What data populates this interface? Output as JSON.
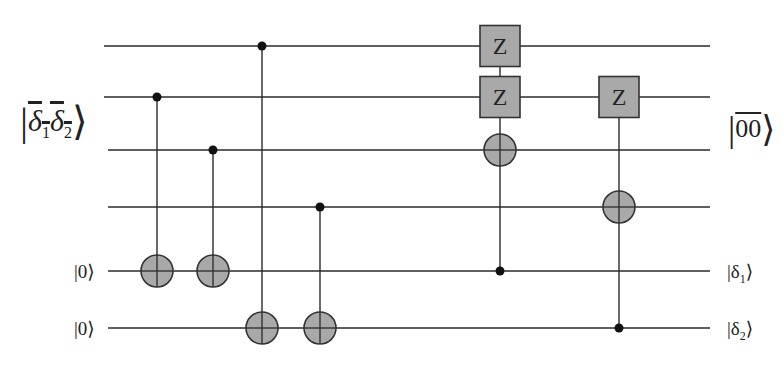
{
  "diagram": {
    "type": "quantum-circuit",
    "colors": {
      "wire": "#2a2a2a",
      "gate_fill": "#a9a9a9",
      "gate_stroke": "#333333",
      "control_dot": "#111111",
      "background": "#ffffff"
    },
    "wires": [
      {
        "id": "q1",
        "y": 46,
        "x_start": 104,
        "x_end": 710
      },
      {
        "id": "q2",
        "y": 97,
        "x_start": 104,
        "x_end": 710
      },
      {
        "id": "q3",
        "y": 150,
        "x_start": 108,
        "x_end": 710
      },
      {
        "id": "q4",
        "y": 207,
        "x_start": 108,
        "x_end": 710
      },
      {
        "id": "q5",
        "y": 271,
        "x_start": 108,
        "x_end": 710
      },
      {
        "id": "q6",
        "y": 328,
        "x_start": 108,
        "x_end": 710
      }
    ],
    "input_labels": {
      "data_register": {
        "symbol": "δ1δ2",
        "parts": [
          "δ",
          "1",
          "δ",
          "2"
        ],
        "overline": true,
        "spans_wires": [
          "q1",
          "q2",
          "q3",
          "q4"
        ]
      },
      "ancilla_1": {
        "text": "|0⟩",
        "wire": "q5"
      },
      "ancilla_2": {
        "text": "|0⟩",
        "wire": "q6"
      }
    },
    "output_labels": {
      "data_register": {
        "text": "00",
        "overline": true,
        "spans_wires": [
          "q1",
          "q2",
          "q3",
          "q4"
        ]
      },
      "ancilla_1": {
        "symbol": "δ",
        "sub": "1",
        "wire": "q5"
      },
      "ancilla_2": {
        "symbol": "δ",
        "sub": "2",
        "wire": "q6"
      }
    },
    "gates": [
      {
        "type": "CNOT",
        "x": 157,
        "control": "q2",
        "target": "q5"
      },
      {
        "type": "CNOT",
        "x": 213,
        "control": "q3",
        "target": "q5"
      },
      {
        "type": "CNOT",
        "x": 262,
        "control": "q1",
        "target": "q6"
      },
      {
        "type": "CNOT",
        "x": 320,
        "control": "q4",
        "target": "q6"
      },
      {
        "type": "controlled-ZZ-X",
        "x": 500,
        "control": "q5",
        "z_on": [
          "q1",
          "q2"
        ],
        "x_target": "q3",
        "label": "Z"
      },
      {
        "type": "controlled-Z-X",
        "x": 619,
        "control": "q6",
        "z_on": [
          "q2"
        ],
        "x_target": "q4",
        "label": "Z"
      }
    ],
    "z_label": "Z"
  }
}
